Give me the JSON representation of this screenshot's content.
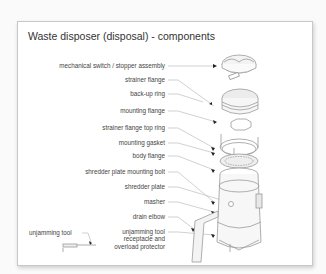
{
  "title": "Waste disposer (disposal) - components",
  "labels": [
    {
      "id": "mechanical-switch",
      "text": "mechanical switch / stopper assembly"
    },
    {
      "id": "strainer-flange",
      "text": "strainer flange"
    },
    {
      "id": "back-up-ring",
      "text": "back-up ring"
    },
    {
      "id": "mounting-flange",
      "text": "mounting flange"
    },
    {
      "id": "strainer-flange-top-ring",
      "text": "strainer flange top ring"
    },
    {
      "id": "mounting-gasket",
      "text": "mounting gasket"
    },
    {
      "id": "body-flange",
      "text": "body flange"
    },
    {
      "id": "shredder-plate-mounting-bolt",
      "text": "shredder plate mounting bolt"
    },
    {
      "id": "shredder-plate",
      "text": "shredder plate"
    },
    {
      "id": "masher",
      "text": "masher"
    },
    {
      "id": "drain-elbow",
      "text": "drain elbow"
    },
    {
      "id": "unjamming-tool-receptacle",
      "text": "unjamming tool receptacle and overload protector"
    },
    {
      "id": "unjamming-tool",
      "text": "unjamming tool"
    }
  ],
  "colors": {
    "line": "#b5b5b5",
    "arrow": "#222222",
    "part_stroke": "#9a9a9a",
    "part_fill": "#f2f2f2"
  }
}
